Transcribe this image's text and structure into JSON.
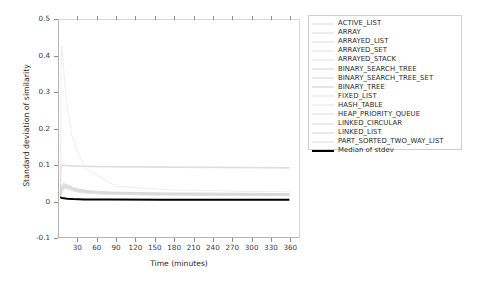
{
  "chart_data": {
    "type": "line",
    "title": "",
    "xlabel": "Time (minutes)",
    "ylabel": "Standard deviation of similarity",
    "xlim": [
      0,
      375
    ],
    "ylim": [
      -0.1,
      0.5
    ],
    "xticks": [
      "30",
      "60",
      "90",
      "120",
      "150",
      "180",
      "210",
      "240",
      "270",
      "300",
      "330",
      "360"
    ],
    "xtick_values": [
      30,
      60,
      90,
      120,
      150,
      180,
      210,
      240,
      270,
      300,
      330,
      360
    ],
    "yticks": [
      "0.5",
      "0.4",
      "0.3",
      "0.2",
      "0.1",
      "0",
      "-0.1"
    ],
    "ytick_values": [
      0.5,
      0.4,
      0.3,
      0.2,
      0.1,
      0,
      -0.1
    ],
    "grid": false,
    "legend_position": "right-outside",
    "series": [
      {
        "name": "ACTIVE_LIST",
        "color": "#d9d9d9",
        "x": [
          2,
          4,
          7,
          12,
          22,
          40,
          80,
          150,
          250,
          360
        ],
        "y": [
          0.012,
          0.031,
          0.045,
          0.04,
          0.03,
          0.022,
          0.018,
          0.016,
          0.015,
          0.014
        ]
      },
      {
        "name": "ARRAY",
        "color": "#dcdcdc",
        "x": [
          2,
          5,
          9,
          16,
          30,
          60,
          120,
          220,
          360
        ],
        "y": [
          0.008,
          0.024,
          0.035,
          0.032,
          0.024,
          0.019,
          0.017,
          0.016,
          0.015
        ]
      },
      {
        "name": "ARRAYED_LIST",
        "color": "#e0dede",
        "x": [
          2,
          4,
          8,
          15,
          28,
          55,
          110,
          200,
          360
        ],
        "y": [
          0.01,
          0.028,
          0.038,
          0.034,
          0.026,
          0.021,
          0.018,
          0.017,
          0.016
        ]
      },
      {
        "name": "ARRAYED_SET",
        "color": "#e3e0e0",
        "x": [
          2,
          4,
          9,
          18,
          34,
          70,
          140,
          250,
          360
        ],
        "y": [
          0.009,
          0.026,
          0.036,
          0.031,
          0.024,
          0.02,
          0.018,
          0.017,
          0.016
        ]
      },
      {
        "name": "ARRAYED_STACK",
        "color": "#e2e2e2",
        "x": [
          2,
          5,
          10,
          20,
          38,
          75,
          150,
          260,
          360
        ],
        "y": [
          0.011,
          0.03,
          0.04,
          0.035,
          0.027,
          0.022,
          0.019,
          0.018,
          0.017
        ]
      },
      {
        "name": "BINARY_SEARCH_TREE",
        "color": "#cfcfcf",
        "x": [
          2,
          3,
          5,
          8,
          14,
          25,
          45,
          90,
          180,
          300,
          360
        ],
        "y": [
          0.02,
          0.098,
          0.1,
          0.099,
          0.098,
          0.097,
          0.096,
          0.095,
          0.094,
          0.093,
          0.092
        ]
      },
      {
        "name": "BINARY_SEARCH_TREE_SET",
        "color": "#d4d4d4",
        "x": [
          2,
          3,
          5,
          9,
          16,
          30,
          55,
          100,
          190,
          300,
          360
        ],
        "y": [
          0.018,
          0.095,
          0.098,
          0.097,
          0.096,
          0.095,
          0.094,
          0.093,
          0.092,
          0.091,
          0.09
        ]
      },
      {
        "name": "BINARY_TREE",
        "color": "#c9c9c9",
        "x": [
          2,
          4,
          7,
          13,
          24,
          45,
          85,
          160,
          280,
          360
        ],
        "y": [
          0.014,
          0.042,
          0.048,
          0.044,
          0.035,
          0.028,
          0.024,
          0.022,
          0.021,
          0.02
        ]
      },
      {
        "name": "FIXED_LIST",
        "color": "#e6e2e2",
        "x": [
          2,
          4,
          8,
          14,
          26,
          50,
          100,
          190,
          320,
          360
        ],
        "y": [
          0.01,
          0.027,
          0.037,
          0.033,
          0.025,
          0.021,
          0.019,
          0.018,
          0.017,
          0.017
        ]
      },
      {
        "name": "HASH_TABLE",
        "color": "#ece4e4",
        "x": [
          2,
          3,
          4,
          6,
          10,
          20,
          40,
          90,
          180,
          300,
          360
        ],
        "y": [
          0.05,
          0.32,
          0.43,
          0.4,
          0.3,
          0.18,
          0.09,
          0.04,
          0.03,
          0.026,
          0.025
        ]
      },
      {
        "name": "HEAP_PRIORITY_QUEUE",
        "color": "#dedede",
        "x": [
          2,
          4,
          8,
          15,
          28,
          55,
          110,
          210,
          340,
          360
        ],
        "y": [
          0.012,
          0.033,
          0.042,
          0.038,
          0.029,
          0.023,
          0.02,
          0.019,
          0.018,
          0.018
        ]
      },
      {
        "name": "LINKED_CIRCULAR",
        "color": "#d7d7d7",
        "x": [
          2,
          4,
          9,
          17,
          32,
          62,
          125,
          230,
          350,
          360
        ],
        "y": [
          0.013,
          0.035,
          0.044,
          0.039,
          0.03,
          0.024,
          0.021,
          0.019,
          0.018,
          0.018
        ]
      },
      {
        "name": "LINKED_LIST",
        "color": "#d2d2d2",
        "x": [
          2,
          4,
          8,
          16,
          30,
          58,
          115,
          215,
          330,
          360
        ],
        "y": [
          0.012,
          0.032,
          0.041,
          0.037,
          0.028,
          0.023,
          0.02,
          0.019,
          0.018,
          0.018
        ]
      },
      {
        "name": "PART_SORTED_TWO_WAY_LIST",
        "color": "#dbdbdb",
        "x": [
          2,
          4,
          9,
          18,
          34,
          66,
          130,
          240,
          350,
          360
        ],
        "y": [
          0.011,
          0.03,
          0.039,
          0.035,
          0.027,
          0.022,
          0.019,
          0.018,
          0.018,
          0.017
        ]
      },
      {
        "name": "Median of stdev",
        "color": "#000000",
        "width": 2,
        "x": [
          2,
          3,
          5,
          8,
          13,
          22,
          40,
          80,
          160,
          260,
          360
        ],
        "y": [
          0.008,
          0.009,
          0.008,
          0.007,
          0.006,
          0.005,
          0.004,
          0.004,
          0.003,
          0.003,
          0.003
        ]
      }
    ]
  },
  "legend": {
    "entries": [
      {
        "label": "ACTIVE_LIST"
      },
      {
        "label": "ARRAY"
      },
      {
        "label": "ARRAYED_LIST"
      },
      {
        "label": "ARRAYED_SET"
      },
      {
        "label": "ARRAYED_STACK"
      },
      {
        "label": "BINARY_SEARCH_TREE"
      },
      {
        "label": "BINARY_SEARCH_TREE_SET"
      },
      {
        "label": "BINARY_TREE"
      },
      {
        "label": "FIXED_LIST"
      },
      {
        "label": "HASH_TABLE"
      },
      {
        "label": "HEAP_PRIORITY_QUEUE"
      },
      {
        "label": "LINKED_CIRCULAR"
      },
      {
        "label": "LINKED_LIST"
      },
      {
        "label": "PART_SORTED_TWO_WAY_LIST"
      },
      {
        "label": "Median of stdev"
      }
    ]
  },
  "axes": {
    "x_title": "Time (minutes)",
    "y_title": "Standard deviation of similarity"
  }
}
